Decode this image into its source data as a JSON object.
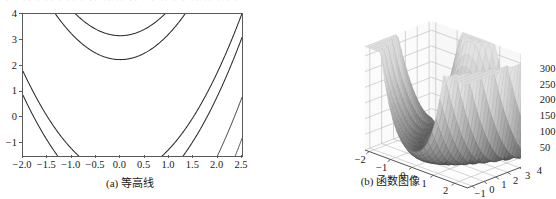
{
  "bleed_text": "· · ·· · ·· ·  ·· · ·· ··  ·· ·· · · ·· · · ·· ·· · · ·",
  "figure": {
    "panel_a": {
      "caption": "(a) 等高线",
      "chart_data": {
        "type": "contour",
        "title": "",
        "xlabel": "",
        "ylabel": "",
        "xlim": [
          -2.0,
          2.5
        ],
        "ylim": [
          -1.5,
          4.0
        ],
        "xticks": [
          "-2.0",
          "-1.5",
          "-1.0",
          "-0.5",
          "0.0",
          "0.5",
          "1.0",
          "1.5",
          "2.0",
          "2.5"
        ],
        "xtick_values": [
          -2.0,
          -1.5,
          -1.0,
          -0.5,
          0.0,
          0.5,
          1.0,
          1.5,
          2.0,
          2.5
        ],
        "yticks": [
          "4",
          "3",
          "2",
          "1",
          "0",
          "-1"
        ],
        "ytick_values": [
          4,
          3,
          2,
          1,
          0,
          -1
        ],
        "grid": false,
        "levels": [
          500,
          1000,
          3000,
          5000,
          7000,
          10000,
          14000
        ],
        "inline_labels": [
          "10000",
          "7000",
          "10000",
          "7000",
          "3000",
          "5000"
        ],
        "function": "Rosenbrock-like banana valley",
        "colormap": "grayscale (dark = low level, light = high level)"
      }
    },
    "panel_b": {
      "caption": "(b) 函数图像",
      "chart_data": {
        "type": "surface",
        "title": "",
        "xlabel": "",
        "ylabel": "",
        "zlabel": "",
        "xticks": [
          "-2",
          "-1",
          "0",
          "1",
          "2"
        ],
        "xtick_values": [
          -2,
          -1,
          0,
          1,
          2
        ],
        "yticks": [
          "-1",
          "0",
          "1",
          "2",
          "3",
          "4"
        ],
        "ytick_values": [
          -1,
          0,
          1,
          2,
          3,
          4
        ],
        "zticks": [
          "300",
          "250",
          "200",
          "150",
          "100",
          "50"
        ],
        "ztick_values": [
          300,
          250,
          200,
          150,
          100,
          50
        ],
        "zlim": [
          0,
          320
        ],
        "grid": true,
        "colormap": "grayscale",
        "description": "Curved valley surface rising to a sharp peak at the right corner"
      }
    }
  },
  "colors": {
    "frame": "#5a5a5a",
    "contour_dark": "#2b2b2b",
    "contour_mid": "#6e6e6e",
    "contour_light": "#bdbdbd",
    "grid_3d": "#b9b9b9",
    "surface_dark": "#4a4a4a",
    "surface_light": "#d8d8d8",
    "text": "#1a1a1a"
  }
}
